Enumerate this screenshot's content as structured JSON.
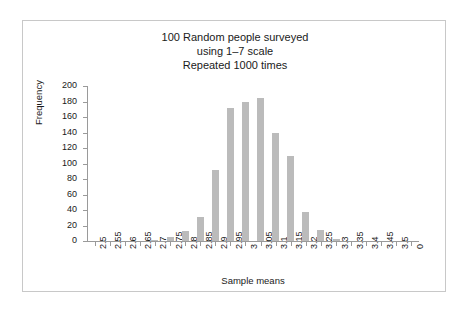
{
  "chart_data": {
    "type": "bar",
    "title": "100 Random people surveyed\nusing 1–7 scale\nRepeated 1000 times",
    "title_lines": [
      "100 Random people surveyed",
      "using 1–7 scale",
      "Repeated 1000 times"
    ],
    "xlabel": "Sample means",
    "ylabel": "Frequency",
    "categories": [
      "2.5",
      "2.55",
      "2.6",
      "2.65",
      "2.7",
      "2.75",
      "2.8",
      "2.85",
      "2.9",
      "2.95",
      "3",
      "3.05",
      "3.1",
      "3.15",
      "3.2",
      "3.25",
      "3.3",
      "3.35",
      "3.4",
      "3.45",
      "3.5",
      "0"
    ],
    "values": [
      0,
      0,
      0,
      0,
      1,
      5,
      13,
      31,
      91,
      171,
      180,
      185,
      140,
      110,
      37,
      14,
      2,
      0,
      0,
      0,
      0,
      0
    ],
    "ylim": [
      0,
      200
    ],
    "yticks": [
      0,
      20,
      40,
      60,
      80,
      100,
      120,
      140,
      160,
      180,
      200
    ],
    "ytick_labels": [
      "0",
      "20",
      "40",
      "60",
      "80",
      "100",
      "120",
      "140",
      "160",
      "180",
      "200"
    ],
    "grid": false,
    "legend": "none",
    "bar_color": "#bbbbbb",
    "axis_color": "#9a9a9a",
    "text_color": "#1a1a1a"
  }
}
